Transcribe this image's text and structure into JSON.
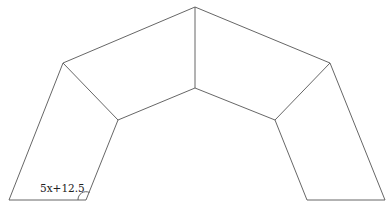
{
  "diagram": {
    "angle_label": "5x+12.5",
    "line_color": "#555555",
    "vertices": {
      "top_outer": [
        195,
        7
      ],
      "top_inner": [
        195,
        88
      ],
      "left_outer": [
        63,
        63
      ],
      "left_inner": [
        118,
        120
      ],
      "right_outer": [
        330,
        63
      ],
      "right_inner": [
        275,
        120
      ],
      "left_base_outer": [
        9,
        200
      ],
      "left_base_inner": [
        86,
        200
      ],
      "right_base_inner": [
        307,
        200
      ],
      "right_base_outer": [
        385,
        200
      ]
    }
  }
}
